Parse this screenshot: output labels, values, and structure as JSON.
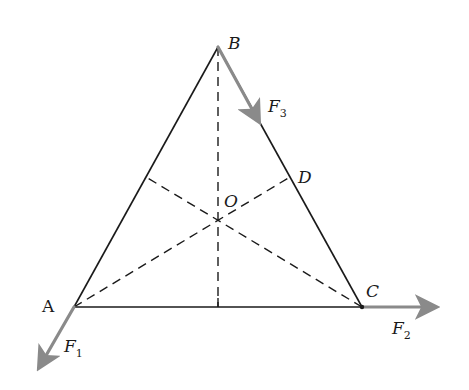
{
  "diagram": {
    "type": "geometry-forces",
    "colors": {
      "line": "#1a1a1a",
      "dashed": "#1a1a1a",
      "force_arrow": "#8a8a8a",
      "background": "#ffffff"
    },
    "points": {
      "A": {
        "label": "A",
        "x": 74,
        "y": 307
      },
      "B": {
        "label": "B",
        "x": 218,
        "y": 47
      },
      "C": {
        "label": "C",
        "x": 362,
        "y": 307
      },
      "D": {
        "label": "D",
        "x": 290,
        "y": 177
      },
      "O": {
        "label": "O",
        "x": 218,
        "y": 220
      },
      "E": {
        "x": 146,
        "y": 177
      },
      "M": {
        "x": 218,
        "y": 307
      }
    },
    "forces": [
      {
        "name": "F1",
        "label": "F",
        "subscript": "1",
        "from": "A",
        "tip": {
          "x": 36,
          "y": 373
        }
      },
      {
        "name": "F2",
        "label": "F",
        "subscript": "2",
        "from": "C",
        "tip": {
          "x": 442,
          "y": 307
        }
      },
      {
        "name": "F3",
        "label": "F",
        "subscript": "3",
        "from": "B",
        "tip": {
          "x": 262,
          "y": 127
        }
      }
    ],
    "labels": {
      "A": "A",
      "B": "B",
      "C": "C",
      "D": "D",
      "O": "O",
      "F": "F",
      "sub1": "1",
      "sub2": "2",
      "sub3": "3"
    }
  }
}
